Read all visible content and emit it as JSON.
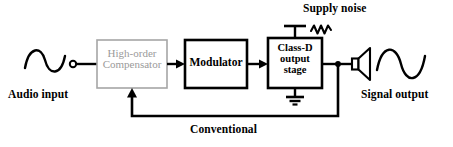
{
  "diagram": {
    "colors": {
      "line": "#000000",
      "block_stroke": "#000000",
      "compensator_stroke": "#a6a6a6",
      "compensator_text": "#9a9a9a",
      "background": "#ffffff"
    },
    "blocks": [
      {
        "id": "compensator",
        "label_line1": "High-order",
        "label_line2": "Compensator",
        "style": "grayed-out",
        "x": 97,
        "y": 40,
        "w": 70,
        "h": 48
      },
      {
        "id": "modulator",
        "label_line1": "Modulator",
        "style": "solid",
        "x": 185,
        "y": 40,
        "w": 62,
        "h": 48
      },
      {
        "id": "class-d-output-stage",
        "label_line1": "Class-D",
        "label_line2": "output",
        "label_line3": "stage",
        "style": "solid",
        "x": 268,
        "y": 38,
        "w": 54,
        "h": 50
      }
    ],
    "labels": {
      "audio_input": "Audio input",
      "signal_output": "Signal output",
      "supply_noise": "Supply noise",
      "conventional": "Conventional"
    },
    "symbols": [
      {
        "name": "sine-wave-input-icon",
        "meaning": "audio input waveform"
      },
      {
        "name": "input-terminal-icon",
        "meaning": "open circle input terminal"
      },
      {
        "name": "noise-zigzag-icon",
        "meaning": "supply noise waveform"
      },
      {
        "name": "supply-rail-icon",
        "meaning": "T-shaped supply connection"
      },
      {
        "name": "ground-icon",
        "meaning": "ground symbol under output stage"
      },
      {
        "name": "speaker-icon",
        "meaning": "loudspeaker"
      },
      {
        "name": "sine-wave-output-icon",
        "meaning": "signal output waveform"
      },
      {
        "name": "junction-dot-icon",
        "meaning": "output node tap for feedback"
      }
    ],
    "connections": [
      {
        "from": "audio-input-terminal",
        "to": "compensator",
        "type": "wire"
      },
      {
        "from": "compensator",
        "to": "modulator",
        "type": "arrow"
      },
      {
        "from": "modulator",
        "to": "class-d-output-stage",
        "type": "arrow"
      },
      {
        "from": "class-d-output-stage",
        "to": "speaker",
        "type": "wire"
      },
      {
        "from": "output-node",
        "to": "compensator",
        "type": "feedback-arrow",
        "label": "Conventional"
      },
      {
        "from": "supply-rail",
        "to": "class-d-output-stage",
        "type": "wire"
      },
      {
        "from": "class-d-output-stage",
        "to": "ground",
        "type": "wire"
      }
    ]
  }
}
